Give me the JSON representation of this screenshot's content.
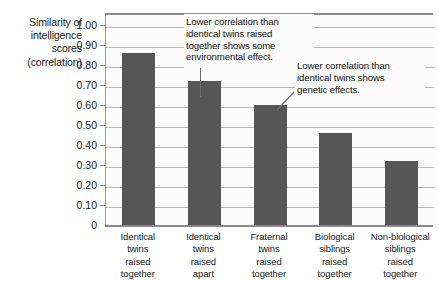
{
  "chart_data": {
    "type": "bar",
    "title": "",
    "subtitle": "",
    "xlabel": "",
    "ylabel": "Similarity of intelligence scores (correlation)",
    "ylabel_lines": [
      "Similarity of",
      "intelligence",
      "scores",
      "(correlation)"
    ],
    "categories": [
      "Identical twins raised together",
      "Identical twins raised apart",
      "Fraternal twins raised together",
      "Biological siblings raised together",
      "Non-biological siblings raised together"
    ],
    "category_lines": [
      [
        "Identical",
        "twins",
        "raised",
        "together"
      ],
      [
        "Identical",
        "twins",
        "raised",
        "apart"
      ],
      [
        "Fraternal",
        "twins",
        "raised",
        "together"
      ],
      [
        "Biological",
        "siblings",
        "raised",
        "together"
      ],
      [
        "Non-biological",
        "siblings",
        "raised",
        "together"
      ]
    ],
    "values": [
      0.86,
      0.72,
      0.6,
      0.46,
      0.32
    ],
    "ylim": [
      0,
      1.0
    ],
    "ytick_values": [
      1.0,
      0.9,
      0.8,
      0.7,
      0.6,
      0.5,
      0.4,
      0.3,
      0.2,
      0.1,
      0
    ],
    "ytick_labels": [
      "1.00",
      "0.90",
      "0.80",
      "0.70",
      "0.60",
      "0.50",
      "0.40",
      "0.30",
      "0.20",
      "0.10",
      "0"
    ],
    "grid": true,
    "legend": "none",
    "bar_color": "#565656",
    "plot_bg_color": "#fbfbfb",
    "gridline_color": "#b9b9b9",
    "axis_color": "#8a8a8a",
    "text_color": "#1a1a1a",
    "annotations": [
      {
        "id": "environmental-effect-note",
        "lines": [
          "Lower correlation than",
          "identical twins raised",
          "together shows some",
          "environmental effect."
        ],
        "points_to_category": "Identical twins raised apart"
      },
      {
        "id": "genetic-effect-note",
        "lines": [
          "Lower correlation than",
          "identical twins shows",
          "genetic effects."
        ],
        "points_to_category": "Fraternal twins raised together"
      }
    ]
  }
}
